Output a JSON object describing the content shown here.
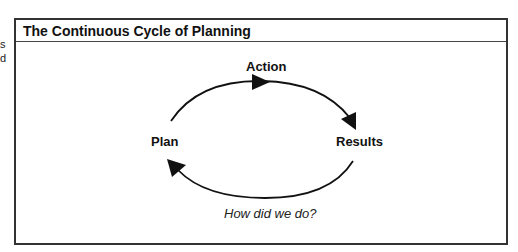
{
  "edge_fragments": [
    "s",
    "d"
  ],
  "panel": {
    "title": "The Continuous Cycle of Planning"
  },
  "diagram": {
    "nodes": {
      "top": "Action",
      "left": "Plan",
      "right": "Results"
    },
    "feedback_label": "How did we do?",
    "stroke_color": "#111111"
  }
}
